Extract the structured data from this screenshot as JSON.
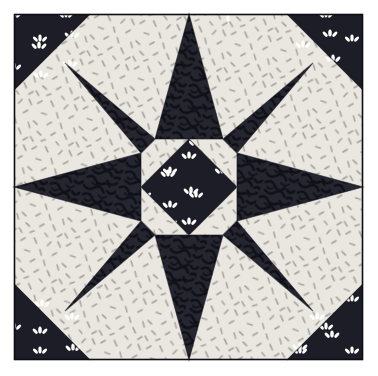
{
  "artwork": {
    "title": "Eight-Pointed Star Quilt Block",
    "kind": "quilt-block",
    "canvas": {
      "width": 378,
      "height": 376,
      "background": "#ffffff"
    },
    "block": {
      "left": 14,
      "top": 14,
      "right": 363,
      "bottom": 360,
      "width": 349,
      "height": 346,
      "center_x": 189,
      "center_y": 187
    }
  },
  "palette": {
    "background": "#ffffff",
    "navy_solid": "#1d1d27",
    "navy_mottled": "#25252f",
    "navy_speckle": "#10101a",
    "cream": "#e8e6df",
    "cream_speckle": "#9a9890",
    "motif_white": "#fdfdfb",
    "outline": "#0d0d14"
  },
  "fabrics": [
    {
      "name": "navy-with-white-sprigs",
      "base": "#1d1d27",
      "motif": "white three-petal sprig",
      "used_in": "corner triangles and center diamond"
    },
    {
      "name": "navy-mottled-texture",
      "base": "#25252f",
      "motif": "dark squiggle mottling",
      "used_in": "eight star points"
    },
    {
      "name": "cream-with-grey-dashes",
      "base": "#e8e6df",
      "motif": "small grey dashes",
      "used_in": "background kites and square-on-point units"
    }
  ],
  "geometry": {
    "description": "LeMoyne-style eight pointed star set in a square block with navy corner triangles",
    "star_points": 8,
    "center_diamond_half_diagonal": 48,
    "star_tip_radius": 175,
    "inner_star_radius": 97,
    "corner_triangle_leg": 76
  },
  "regions": [
    {
      "id": "corner-top-left",
      "fabric": "navy-with-white-sprigs"
    },
    {
      "id": "corner-top-right",
      "fabric": "navy-with-white-sprigs"
    },
    {
      "id": "corner-bottom-left",
      "fabric": "navy-with-white-sprigs"
    },
    {
      "id": "corner-bottom-right",
      "fabric": "navy-with-white-sprigs"
    },
    {
      "id": "star-point-n",
      "fabric": "navy-mottled-texture"
    },
    {
      "id": "star-point-ne",
      "fabric": "navy-mottled-texture"
    },
    {
      "id": "star-point-e",
      "fabric": "navy-mottled-texture"
    },
    {
      "id": "star-point-se",
      "fabric": "navy-mottled-texture"
    },
    {
      "id": "star-point-s",
      "fabric": "navy-mottled-texture"
    },
    {
      "id": "star-point-sw",
      "fabric": "navy-mottled-texture"
    },
    {
      "id": "star-point-w",
      "fabric": "navy-mottled-texture"
    },
    {
      "id": "star-point-nw",
      "fabric": "navy-mottled-texture"
    },
    {
      "id": "center-diamond",
      "fabric": "navy-with-white-sprigs"
    },
    {
      "id": "background-kite-n",
      "fabric": "cream-with-grey-dashes"
    },
    {
      "id": "background-kite-e",
      "fabric": "cream-with-grey-dashes"
    },
    {
      "id": "background-kite-s",
      "fabric": "cream-with-grey-dashes"
    },
    {
      "id": "background-kite-w",
      "fabric": "cream-with-grey-dashes"
    },
    {
      "id": "inner-square-ne",
      "fabric": "cream-with-grey-dashes"
    },
    {
      "id": "inner-square-se",
      "fabric": "cream-with-grey-dashes"
    },
    {
      "id": "inner-square-sw",
      "fabric": "cream-with-grey-dashes"
    },
    {
      "id": "inner-square-nw",
      "fabric": "cream-with-grey-dashes"
    }
  ]
}
